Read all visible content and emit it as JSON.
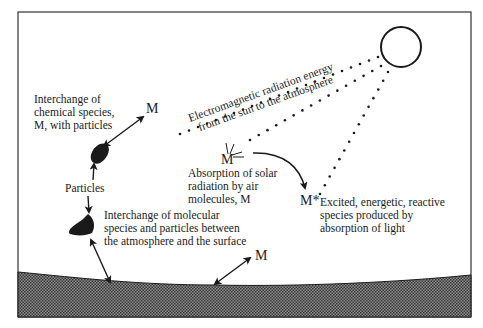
{
  "diagram": {
    "sun_label": "sun",
    "radiation_label": {
      "line1": "Electromagnetic radiation energy",
      "line2": "from the sun to the atmosphere"
    },
    "particle_exchange_label": {
      "line1": "Interchange of",
      "line2": "chemical species,",
      "line3": "M, with particles"
    },
    "particles_label": "Particles",
    "surface_exchange_label": {
      "line1": "Interchange of molecular",
      "line2": "species and particles between",
      "line3": "the atmosphere and the surface"
    },
    "absorption_label": {
      "line1": "Absorption of solar",
      "line2": "radiation by air",
      "line3": "molecules, M"
    },
    "excited_label": {
      "line1": "Excited, energetic, reactive",
      "line2": "species produced by",
      "line3": "absorption of light"
    },
    "symbols": {
      "m_particle": "M",
      "m_absorb": "M",
      "m_excited": "M*",
      "m_surface": "M"
    },
    "colors": {
      "ink": "#1a1a1a",
      "ground": "#6e6e6e",
      "frame": "#333333"
    }
  }
}
